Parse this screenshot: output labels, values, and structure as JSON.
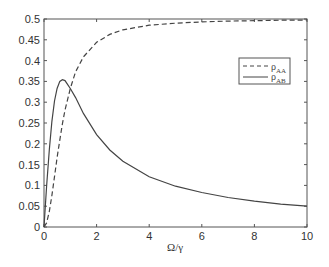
{
  "chart_data": {
    "type": "line",
    "title": "",
    "xlabel": "Ω/γ",
    "ylabel": "",
    "xlim": [
      0,
      10
    ],
    "ylim": [
      0,
      0.5
    ],
    "grid": false,
    "legend_position": "upper right",
    "x_ticks": [
      "0",
      "2",
      "4",
      "6",
      "8",
      "10"
    ],
    "y_ticks": [
      "0",
      "0.05",
      "0.1",
      "0.15",
      "0.2",
      "0.25",
      "0.3",
      "0.35",
      "0.4",
      "0.45",
      "0.5"
    ],
    "x": [
      0,
      0.1,
      0.2,
      0.3,
      0.4,
      0.5,
      0.6,
      0.7,
      0.8,
      1,
      1.2,
      1.5,
      2,
      2.5,
      3,
      4,
      5,
      6,
      7,
      8,
      9,
      10
    ],
    "series": [
      {
        "name": "ρ_AA",
        "style": "dashed",
        "values": [
          0,
          0.0098,
          0.037,
          0.076,
          0.121,
          0.167,
          0.209,
          0.248,
          0.281,
          0.333,
          0.373,
          0.409,
          0.444,
          0.463,
          0.474,
          0.485,
          0.49,
          0.493,
          0.495,
          0.496,
          0.497,
          0.4975
        ]
      },
      {
        "name": "ρ_AB",
        "style": "solid",
        "values": [
          0,
          0.098,
          0.185,
          0.254,
          0.303,
          0.333,
          0.35,
          0.354,
          0.352,
          0.333,
          0.311,
          0.273,
          0.222,
          0.185,
          0.158,
          0.121,
          0.098,
          0.083,
          0.071,
          0.062,
          0.055,
          0.05
        ]
      }
    ]
  },
  "legend": {
    "entries": [
      {
        "symbol": "ρ",
        "sub": "AA"
      },
      {
        "symbol": "ρ",
        "sub": "AB"
      }
    ]
  },
  "colors": {
    "line": "#444444",
    "axis": "#555555"
  }
}
